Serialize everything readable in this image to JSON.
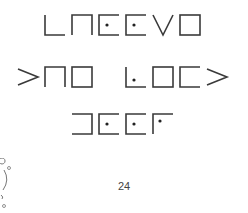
{
  "cipher": {
    "type": "pigpen",
    "rows": [
      {
        "glyphs": [
          "corner-bl",
          "open-bottom",
          "open-right-dot",
          "open-right-dot",
          "chevron-down",
          "box"
        ]
      },
      {
        "glyphs": [
          "chevron-right",
          "open-bottom",
          "box",
          "space",
          "corner-bl-dot",
          "box",
          "open-right",
          "chevron-right"
        ]
      },
      {
        "glyphs": [
          "open-left",
          "open-right-dot",
          "open-right-dot",
          "corner-tl-dot"
        ]
      }
    ]
  },
  "page_number": "24",
  "doodle": "small-figure-doodle"
}
